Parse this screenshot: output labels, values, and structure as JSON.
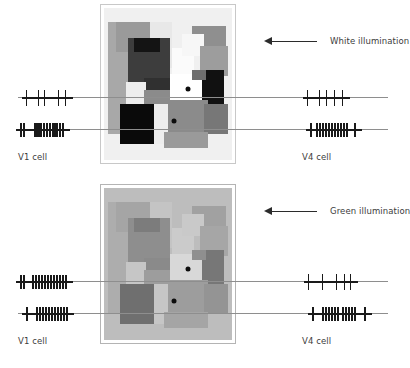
{
  "figure": {
    "background": "#ffffff"
  },
  "panels": [
    {
      "id": "white",
      "illumination_label": "White illumination",
      "frame_color": "#c8c8c8",
      "background": "#f2f2f2",
      "x": 104,
      "y": 8,
      "width": 128,
      "height": 152,
      "patches": [
        {
          "x": 0,
          "y": 0,
          "w": 128,
          "h": 152,
          "color": "#f0f0f0"
        },
        {
          "x": 4,
          "y": 14,
          "w": 20,
          "h": 112,
          "color": "#a8a8a8"
        },
        {
          "x": 12,
          "y": 14,
          "w": 34,
          "h": 30,
          "color": "#9a9a9a"
        },
        {
          "x": 46,
          "y": 14,
          "w": 22,
          "h": 46,
          "color": "#e8e8e8"
        },
        {
          "x": 24,
          "y": 30,
          "w": 42,
          "h": 52,
          "color": "#3d3d3d"
        },
        {
          "x": 30,
          "y": 30,
          "w": 26,
          "h": 14,
          "color": "#141414"
        },
        {
          "x": 68,
          "y": 40,
          "w": 22,
          "h": 36,
          "color": "#fbfbfb"
        },
        {
          "x": 88,
          "y": 18,
          "w": 34,
          "h": 28,
          "color": "#8f8f8f"
        },
        {
          "x": 78,
          "y": 26,
          "w": 22,
          "h": 22,
          "color": "#f7f7f7"
        },
        {
          "x": 96,
          "y": 38,
          "w": 28,
          "h": 30,
          "color": "#9d9d9d"
        },
        {
          "x": 40,
          "y": 70,
          "w": 50,
          "h": 16,
          "color": "#303030"
        },
        {
          "x": 22,
          "y": 74,
          "w": 20,
          "h": 22,
          "color": "#ededed"
        },
        {
          "x": 40,
          "y": 82,
          "w": 26,
          "h": 36,
          "color": "#8b8b8b"
        },
        {
          "x": 66,
          "y": 66,
          "w": 34,
          "h": 30,
          "color": "#ffffff"
        },
        {
          "x": 98,
          "y": 62,
          "w": 22,
          "h": 38,
          "color": "#111111"
        },
        {
          "x": 88,
          "y": 62,
          "w": 14,
          "h": 10,
          "color": "#6e6e6e"
        },
        {
          "x": 16,
          "y": 96,
          "w": 34,
          "h": 40,
          "color": "#0a0a0a"
        },
        {
          "x": 50,
          "y": 96,
          "w": 20,
          "h": 40,
          "color": "#ededed"
        },
        {
          "x": 64,
          "y": 92,
          "w": 40,
          "h": 34,
          "color": "#8b8b8b"
        },
        {
          "x": 100,
          "y": 96,
          "w": 24,
          "h": 30,
          "color": "#777777"
        },
        {
          "x": 60,
          "y": 124,
          "w": 44,
          "h": 16,
          "color": "#9a9a9a"
        }
      ],
      "recording_dots": [
        {
          "name": "v4-recording-site",
          "x": 84,
          "y": 81
        },
        {
          "name": "v1-recording-site",
          "x": 70,
          "y": 113
        }
      ]
    },
    {
      "id": "green",
      "illumination_label": "Green illumination",
      "frame_color": "#b4b4b4",
      "background": "#b9b9b9",
      "x": 104,
      "y": 188,
      "width": 128,
      "height": 152,
      "patches": [
        {
          "x": 0,
          "y": 0,
          "w": 128,
          "h": 152,
          "color": "#bdbdbd"
        },
        {
          "x": 4,
          "y": 14,
          "w": 20,
          "h": 112,
          "color": "#adadad"
        },
        {
          "x": 12,
          "y": 14,
          "w": 34,
          "h": 30,
          "color": "#a5a5a5"
        },
        {
          "x": 46,
          "y": 14,
          "w": 22,
          "h": 46,
          "color": "#c4c4c4"
        },
        {
          "x": 24,
          "y": 30,
          "w": 42,
          "h": 52,
          "color": "#8e8e8e"
        },
        {
          "x": 30,
          "y": 30,
          "w": 26,
          "h": 14,
          "color": "#7c7c7c"
        },
        {
          "x": 68,
          "y": 40,
          "w": 22,
          "h": 36,
          "color": "#cbcbcb"
        },
        {
          "x": 88,
          "y": 18,
          "w": 34,
          "h": 28,
          "color": "#a1a1a1"
        },
        {
          "x": 78,
          "y": 26,
          "w": 22,
          "h": 22,
          "color": "#c9c9c9"
        },
        {
          "x": 96,
          "y": 38,
          "w": 28,
          "h": 30,
          "color": "#a6a6a6"
        },
        {
          "x": 40,
          "y": 70,
          "w": 50,
          "h": 16,
          "color": "#8a8a8a"
        },
        {
          "x": 22,
          "y": 74,
          "w": 20,
          "h": 22,
          "color": "#c6c6c6"
        },
        {
          "x": 40,
          "y": 82,
          "w": 26,
          "h": 36,
          "color": "#9d9d9d"
        },
        {
          "x": 66,
          "y": 66,
          "w": 34,
          "h": 30,
          "color": "#d8d8d8"
        },
        {
          "x": 98,
          "y": 62,
          "w": 22,
          "h": 38,
          "color": "#777777"
        },
        {
          "x": 88,
          "y": 62,
          "w": 14,
          "h": 10,
          "color": "#8f8f8f"
        },
        {
          "x": 16,
          "y": 96,
          "w": 34,
          "h": 40,
          "color": "#6f6f6f"
        },
        {
          "x": 50,
          "y": 96,
          "w": 20,
          "h": 40,
          "color": "#c6c6c6"
        },
        {
          "x": 64,
          "y": 92,
          "w": 40,
          "h": 34,
          "color": "#9d9d9d"
        },
        {
          "x": 100,
          "y": 96,
          "w": 24,
          "h": 30,
          "color": "#949494"
        },
        {
          "x": 60,
          "y": 124,
          "w": 44,
          "h": 16,
          "color": "#a5a5a5"
        }
      ],
      "recording_dots": [
        {
          "name": "v4-recording-site",
          "x": 84,
          "y": 81
        },
        {
          "name": "v1-recording-site",
          "x": 70,
          "y": 113
        }
      ]
    }
  ],
  "cell_labels": {
    "v1": "V1 cell",
    "v4": "V4 cell"
  },
  "chart_data": {
    "type": "raster",
    "xlabel": "",
    "ylabel": "",
    "series": [
      {
        "name": "white-v4-top-left",
        "panel": "white",
        "side": "left",
        "row": "upper",
        "cell": "V4",
        "spike_count": 5,
        "pattern": "sparse",
        "spike_positions": [
          8,
          20,
          26,
          40,
          47
        ]
      },
      {
        "name": "white-v1-bottom-left",
        "panel": "white",
        "side": "left",
        "row": "lower",
        "cell": "V1",
        "spike_count": 14,
        "pattern": "burst",
        "spike_positions": [
          6,
          9,
          20,
          22,
          24,
          26,
          29,
          32,
          35,
          38,
          40,
          42,
          45,
          48
        ]
      },
      {
        "name": "white-v4-top-right",
        "panel": "white",
        "side": "right",
        "row": "upper",
        "cell": "V4",
        "spike_count": 5,
        "pattern": "sparse",
        "spike_positions": [
          9,
          21,
          28,
          36,
          44
        ]
      },
      {
        "name": "white-v1-bottom-right",
        "panel": "white",
        "side": "right",
        "row": "lower",
        "cell": "V1",
        "spike_count": 13,
        "pattern": "burst",
        "spike_positions": [
          8,
          14,
          17,
          20,
          23,
          26,
          29,
          32,
          35,
          38,
          41,
          44,
          52
        ]
      },
      {
        "name": "green-v4-top-left",
        "panel": "green",
        "side": "left",
        "row": "upper",
        "cell": "V4",
        "spike_count": 14,
        "pattern": "burst",
        "spike_positions": [
          6,
          9,
          18,
          21,
          24,
          27,
          30,
          33,
          36,
          39,
          42,
          45,
          48,
          51
        ]
      },
      {
        "name": "green-v1-bottom-left",
        "panel": "green",
        "side": "left",
        "row": "lower",
        "cell": "V1",
        "spike_count": 12,
        "pattern": "burst",
        "spike_positions": [
          8,
          18,
          21,
          24,
          27,
          30,
          33,
          36,
          39,
          42,
          45,
          48
        ]
      },
      {
        "name": "green-v4-top-right",
        "panel": "green",
        "side": "right",
        "row": "upper",
        "cell": "V4",
        "spike_count": 5,
        "pattern": "sparse",
        "spike_positions": [
          10,
          24,
          38,
          46,
          52
        ]
      },
      {
        "name": "green-v1-bottom-right",
        "panel": "green",
        "side": "right",
        "row": "lower",
        "cell": "V1",
        "spike_count": 13,
        "pattern": "burst",
        "spike_positions": [
          10,
          20,
          23,
          26,
          29,
          32,
          35,
          40,
          43,
          46,
          49,
          52,
          62
        ]
      }
    ]
  }
}
